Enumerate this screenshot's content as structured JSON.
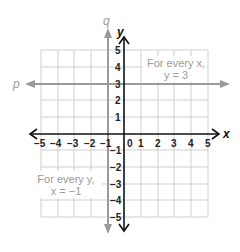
{
  "diagram": {
    "type": "coordinate_plane",
    "x_range": [
      -5,
      5
    ],
    "y_range": [
      -5,
      5
    ],
    "grid": true,
    "axes": {
      "x_label": "x",
      "y_label": "y"
    },
    "x_ticks": [
      "−5",
      "−4",
      "−3",
      "−2",
      "−1",
      "0",
      "1",
      "2",
      "3",
      "4",
      "5"
    ],
    "y_ticks_positive": [
      "5",
      "4",
      "3",
      "2",
      "1"
    ],
    "y_ticks_negative": [
      "−1",
      "−2",
      "−3",
      "−4",
      "−5"
    ],
    "lines": [
      {
        "name": "p",
        "label": "p",
        "equation": "y = 3",
        "orientation": "horizontal",
        "color": "#9a9a9a"
      },
      {
        "name": "q",
        "label": "q",
        "equation": "x = −1",
        "orientation": "vertical",
        "color": "#9a9a9a"
      }
    ],
    "annotations": {
      "p_note_line1": "For every x,",
      "p_note_line2": "y = 3",
      "q_note_line1": "For every y,",
      "q_note_line2": "x = −1"
    },
    "colors": {
      "grid": "#c8c8c8",
      "axis": "#111111",
      "line": "#9a9a9a",
      "note_text": "#9a9a9a"
    }
  }
}
